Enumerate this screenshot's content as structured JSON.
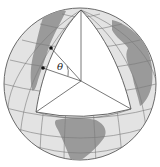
{
  "figure": {
    "type": "globe-wedge-diagram",
    "angle_label": "θ",
    "colors": {
      "ocean": "#e3e3e3",
      "land": "#9a9a9a",
      "grid": "#7a7a7a",
      "cut_face": "#ffffff",
      "edge": "#555555",
      "outline": "#6a6a6a"
    },
    "points": {
      "north_pole": [
        81,
        10
      ],
      "center": [
        81,
        81
      ],
      "left_equator": [
        36,
        112
      ],
      "right_equator": [
        131,
        109
      ],
      "dot_upper": [
        51,
        48
      ],
      "dot_lower": [
        43,
        68
      ]
    }
  }
}
